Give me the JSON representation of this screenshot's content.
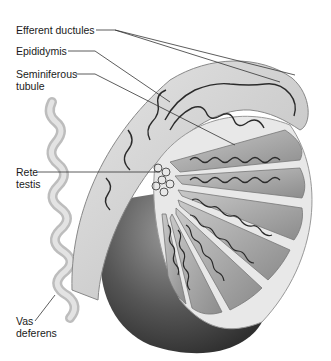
{
  "figure": {
    "labels": [
      {
        "id": "efferent-ductules",
        "text": "Efferent ductules"
      },
      {
        "id": "epididymis",
        "text": "Epididymis"
      },
      {
        "id": "seminiferous-tubule",
        "text": "Seminiferous\ntubule"
      },
      {
        "id": "rete-testis",
        "text": "Rete\ntestis"
      },
      {
        "id": "vas-deferens",
        "text": "Vas\ndeferens"
      }
    ]
  },
  "colors": {
    "background": "#ffffff",
    "label_text": "#1a1a1a",
    "leader_line": "#333333",
    "tunica_dark": "#4a4a4a",
    "lobule_fill": "#9a9a9a",
    "epididymis_fill": "#d0d0d0",
    "tubule_stroke": "#2a2a2a"
  }
}
